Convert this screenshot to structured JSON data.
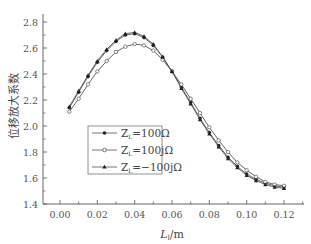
{
  "chart_data": {
    "type": "line",
    "title": "",
    "xlabel": "L_l/m",
    "xlabel_main": "L",
    "xlabel_sub": "l",
    "xlabel_unit": "/m",
    "ylabel": "位移放大系数",
    "xlim": [
      -0.005,
      0.13
    ],
    "ylim": [
      1.4,
      2.8
    ],
    "x_ticks": [
      "0.00",
      "0.02",
      "0.04",
      "0.06",
      "0.08",
      "0.10",
      "0.12"
    ],
    "x_tick_values": [
      0.0,
      0.02,
      0.04,
      0.06,
      0.08,
      0.1,
      0.12
    ],
    "y_ticks": [
      "1.4",
      "1.6",
      "1.8",
      "2.0",
      "2.2",
      "2.4",
      "2.6",
      "2.8"
    ],
    "y_tick_values": [
      1.4,
      1.6,
      1.8,
      2.0,
      2.2,
      2.4,
      2.6,
      2.8
    ],
    "grid": false,
    "legend_position": "center-left",
    "x": [
      0.005,
      0.01,
      0.015,
      0.02,
      0.025,
      0.03,
      0.035,
      0.04,
      0.045,
      0.05,
      0.055,
      0.06,
      0.065,
      0.07,
      0.075,
      0.08,
      0.085,
      0.09,
      0.095,
      0.1,
      0.105,
      0.11,
      0.115,
      0.12
    ],
    "series": [
      {
        "name": "Z_L=100Ω",
        "legend_main": "Z",
        "legend_sub": "L",
        "legend_rest": "=100Ω",
        "marker": "filled-circle",
        "values": [
          2.14,
          2.26,
          2.38,
          2.49,
          2.58,
          2.65,
          2.7,
          2.71,
          2.68,
          2.62,
          2.53,
          2.42,
          2.3,
          2.18,
          2.06,
          1.95,
          1.85,
          1.76,
          1.69,
          1.63,
          1.59,
          1.56,
          1.54,
          1.53
        ]
      },
      {
        "name": "Z_L=100jΩ",
        "legend_main": "Z",
        "legend_sub": "L",
        "legend_rest": "=100jΩ",
        "marker": "open-circle",
        "values": [
          2.11,
          2.21,
          2.32,
          2.42,
          2.5,
          2.57,
          2.61,
          2.63,
          2.62,
          2.58,
          2.51,
          2.42,
          2.32,
          2.21,
          2.1,
          1.99,
          1.89,
          1.8,
          1.72,
          1.66,
          1.61,
          1.57,
          1.55,
          1.54
        ]
      },
      {
        "name": "Z_L=−100jΩ",
        "legend_main": "Z",
        "legend_sub": "L",
        "legend_rest": "=−100jΩ",
        "marker": "filled-triangle",
        "values": [
          2.15,
          2.27,
          2.39,
          2.5,
          2.59,
          2.66,
          2.71,
          2.72,
          2.69,
          2.63,
          2.53,
          2.42,
          2.29,
          2.17,
          2.05,
          1.94,
          1.84,
          1.75,
          1.68,
          1.62,
          1.58,
          1.55,
          1.53,
          1.52
        ]
      }
    ]
  },
  "colors": {
    "axis": "#555555",
    "series_line": "#555555",
    "marker_fill": "#222222",
    "open_marker_fill": "#ffffff",
    "legend_border": "#666666"
  }
}
